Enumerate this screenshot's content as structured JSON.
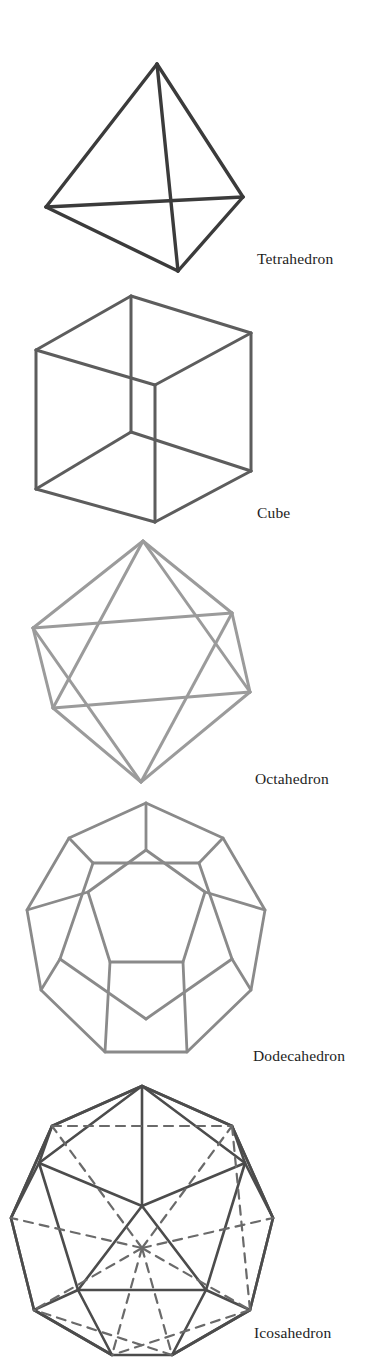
{
  "page": {
    "background_color": "#ffffff",
    "width": 391,
    "height": 1368
  },
  "figures": [
    {
      "id": "tetrahedron",
      "caption": "Tetrahedron",
      "faces": 4,
      "vertices": 4,
      "edges": 6,
      "stroke_color": "#3b3b3b",
      "stroke_width": 3.2,
      "caption_x": 257,
      "caption_y": 262
    },
    {
      "id": "cube",
      "caption": "Cube",
      "faces": 6,
      "vertices": 8,
      "edges": 12,
      "stroke_color": "#5d5d5d",
      "stroke_width": 3.0,
      "caption_x": 257,
      "caption_y": 514
    },
    {
      "id": "octahedron",
      "caption": "Octahedron",
      "faces": 8,
      "vertices": 6,
      "edges": 12,
      "stroke_color": "#9b9b9b",
      "stroke_width": 3.0,
      "caption_x": 255,
      "caption_y": 782
    },
    {
      "id": "dodecahedron",
      "caption": "Dodecahedron",
      "faces": 12,
      "vertices": 20,
      "edges": 30,
      "stroke_color": "#8a8a8a",
      "stroke_width": 2.6,
      "caption_x": 253,
      "caption_y": 1063
    },
    {
      "id": "icosahedron",
      "caption": "Icosahedron",
      "faces": 20,
      "vertices": 12,
      "edges": 30,
      "stroke_color": "#4c4c4c",
      "stroke_width": 2.4,
      "caption_x": 254,
      "caption_y": 1337
    }
  ]
}
